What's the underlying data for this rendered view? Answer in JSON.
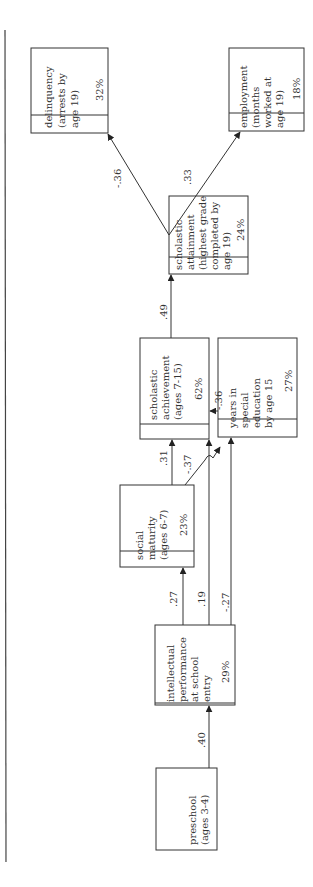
{
  "diagram": {
    "type": "path-diagram",
    "orientation": "rotated-90-ccw",
    "nodes": [
      {
        "id": "preschool",
        "lines": [
          "preschool",
          "(ages 3-4)"
        ],
        "variance": ""
      },
      {
        "id": "intellectual",
        "lines": [
          "intellectual",
          "performance",
          "at school",
          "entry"
        ],
        "variance": "29%"
      },
      {
        "id": "social",
        "lines": [
          "social",
          "maturity",
          "(ages 6-7)"
        ],
        "variance": "23%"
      },
      {
        "id": "achievement",
        "lines": [
          "scholastic",
          "achievement",
          "(ages 7-15)"
        ],
        "variance": "62%"
      },
      {
        "id": "special_ed",
        "lines": [
          "years in",
          "special",
          "education",
          "by age 15"
        ],
        "variance": "27%"
      },
      {
        "id": "attainment",
        "lines": [
          "scholastic",
          "attainment",
          "(highest grade",
          "completed by",
          "age 19)"
        ],
        "variance": "24%"
      },
      {
        "id": "delinquency",
        "lines": [
          "delinquency",
          "(arrests by",
          "age 19)"
        ],
        "variance": "32%"
      },
      {
        "id": "employment",
        "lines": [
          "employment",
          "(months",
          "worked at",
          "age 19)"
        ],
        "variance": "18%"
      }
    ],
    "edges": [
      {
        "from": "preschool",
        "to": "intellectual",
        "coef": ".40"
      },
      {
        "from": "intellectual",
        "to": "social",
        "coef": ".27"
      },
      {
        "from": "intellectual",
        "to": "achievement",
        "coef": ".19"
      },
      {
        "from": "intellectual",
        "to": "special_ed",
        "coef": "-.27"
      },
      {
        "from": "social",
        "to": "achievement",
        "coef": ".31"
      },
      {
        "from": "social",
        "to": "special_ed",
        "coef": "-.37"
      },
      {
        "from": "special_ed",
        "to": "achievement",
        "coef": "-.36"
      },
      {
        "from": "achievement",
        "to": "attainment",
        "coef": ".49"
      },
      {
        "from": "attainment",
        "to": "delinquency",
        "coef": "-.36"
      },
      {
        "from": "attainment",
        "to": "employment",
        "coef": ".33"
      }
    ]
  }
}
